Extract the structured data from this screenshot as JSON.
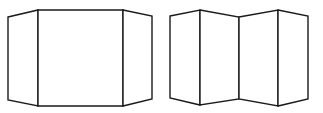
{
  "diagram": {
    "colors": {
      "line": "#1a1a1a",
      "background": "#ffffff"
    },
    "figures": [
      {
        "name": "three-panel-screen",
        "panels": [
          {
            "name": "left-wing",
            "points": "8,17 38,10 38,106 8,100"
          },
          {
            "name": "center",
            "points": "38,10 123,10 123,106 38,106"
          },
          {
            "name": "right-wing",
            "points": "123,10 152,16 152,99 123,106"
          }
        ]
      },
      {
        "name": "four-panel-zigzag-screen",
        "panels": [
          {
            "name": "panel-1",
            "points": "170,16 200,10 200,105 170,98"
          },
          {
            "name": "panel-2",
            "points": "200,10 239,17 239,99 200,105"
          },
          {
            "name": "panel-3",
            "points": "239,17 278,10 278,106 239,99"
          },
          {
            "name": "panel-4",
            "points": "278,10 308,16 308,99 278,106"
          }
        ]
      }
    ]
  }
}
